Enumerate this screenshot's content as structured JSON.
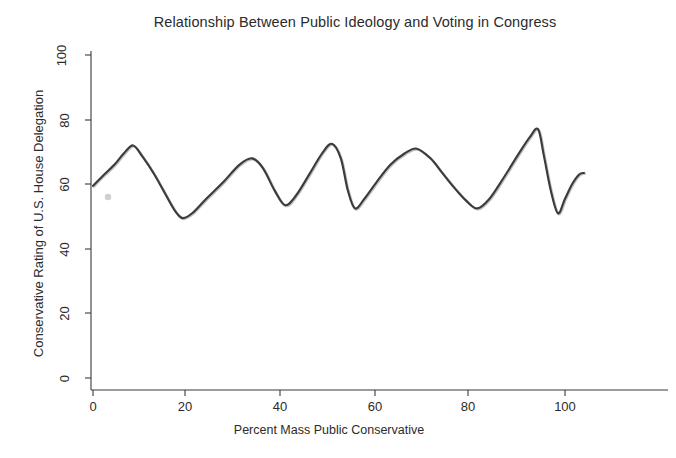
{
  "chart_data": {
    "type": "line",
    "title": "Relationship Between Public Ideology and Voting in Congress",
    "xlabel": "Percent Mass Public Conservative",
    "ylabel": "Conservative Rating of U.S. House Delegation",
    "xlim": [
      0,
      104
    ],
    "ylim": [
      0,
      100
    ],
    "xticks": [
      0,
      20,
      40,
      60,
      80,
      100
    ],
    "xtick_labels": [
      "0",
      "20",
      "40",
      "60",
      "80",
      "100"
    ],
    "yticks": [
      0,
      20,
      40,
      60,
      80,
      100
    ],
    "ytick_labels": [
      "0",
      "20",
      "40",
      "60",
      "80",
      "100"
    ],
    "grid": false,
    "legend": "none",
    "series": [
      {
        "name": "Lowess fit of House conservative rating",
        "color": "#3b3b3b",
        "x": [
          0.0,
          2.0,
          4.5,
          6.5,
          8.5,
          10.5,
          13.0,
          15.5,
          17.5,
          19.0,
          21.0,
          24.0,
          27.5,
          31.0,
          33.7,
          36.0,
          38.5,
          40.7,
          43.0,
          46.0,
          48.5,
          50.6,
          52.5,
          54.0,
          55.5,
          57.5,
          60.0,
          63.0,
          66.0,
          68.6,
          71.5,
          74.0,
          76.5,
          79.0,
          81.4,
          84.0,
          87.0,
          90.0,
          92.5,
          94.3,
          95.5,
          97.0,
          98.5,
          100.0,
          101.5,
          103.0,
          104.0
        ],
        "y": [
          59.5,
          62.5,
          66.0,
          69.5,
          72.0,
          68.5,
          63.0,
          56.5,
          51.5,
          49.5,
          51.0,
          55.5,
          60.5,
          66.0,
          68.0,
          65.0,
          58.0,
          53.5,
          56.5,
          63.5,
          69.5,
          72.5,
          68.0,
          58.0,
          52.5,
          55.5,
          60.5,
          66.0,
          69.5,
          71.0,
          68.0,
          63.5,
          59.0,
          55.0,
          52.5,
          55.5,
          62.0,
          69.0,
          74.5,
          77.0,
          69.0,
          58.0,
          51.0,
          55.5,
          60.0,
          63.0,
          63.5
        ]
      }
    ],
    "annotations": [
      {
        "type": "peak",
        "x": 8.5,
        "y": 72.0
      },
      {
        "type": "trough",
        "x": 19.0,
        "y": 49.5
      },
      {
        "type": "peak",
        "x": 33.7,
        "y": 68.0
      },
      {
        "type": "trough",
        "x": 40.7,
        "y": 53.5
      },
      {
        "type": "peak",
        "x": 50.6,
        "y": 72.5
      },
      {
        "type": "trough",
        "x": 55.5,
        "y": 52.5
      },
      {
        "type": "peak",
        "x": 68.6,
        "y": 71.0
      },
      {
        "type": "trough",
        "x": 81.4,
        "y": 52.5
      },
      {
        "type": "peak",
        "x": 94.3,
        "y": 77.0
      },
      {
        "type": "trough",
        "x": 98.5,
        "y": 51.0
      }
    ]
  },
  "axes": {
    "x_tick_labels": [
      "0",
      "20",
      "40",
      "60",
      "80",
      "100"
    ],
    "y_tick_labels": [
      "0",
      "20",
      "40",
      "60",
      "80",
      "100"
    ]
  }
}
